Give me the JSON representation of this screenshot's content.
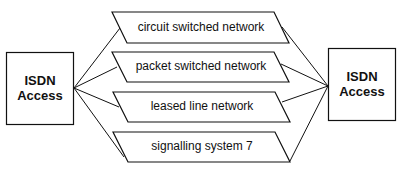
{
  "diagram": {
    "left_node": {
      "line1": "ISDN",
      "line2": "Access"
    },
    "right_node": {
      "line1": "ISDN",
      "line2": "Access"
    },
    "networks": [
      {
        "label": "circuit switched network"
      },
      {
        "label": "packet switched network"
      },
      {
        "label": "leased line network"
      },
      {
        "label": "signalling system 7"
      }
    ],
    "colors": {
      "stroke": "#111111",
      "fill": "#ffffff"
    }
  }
}
